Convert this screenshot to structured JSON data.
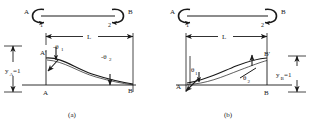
{
  "figure": {
    "caption_a": "(a)",
    "caption_b": "(b)"
  },
  "panel_a": {
    "moment_diagram": {
      "label_A": "A",
      "label_B": "B",
      "label_1": "1",
      "label_2": "2"
    },
    "dimension": {
      "label_L": "L"
    },
    "labels": {
      "A_prime": "A'",
      "A": "A",
      "B": "B",
      "theta1": "-θ",
      "theta1_sub": "1",
      "theta2": "-θ",
      "theta2_sub": "2",
      "deflection": "y",
      "deflection_sub": "A",
      "deflection_value": "=1"
    }
  },
  "panel_b": {
    "moment_diagram": {
      "label_A": "A",
      "label_B": "B",
      "label_1": "1",
      "label_2": "2"
    },
    "dimension": {
      "label_L": "L"
    },
    "labels": {
      "B_prime": "B'",
      "A": "A",
      "B": "B",
      "theta1": "θ",
      "theta1_sub": "1",
      "theta2": "θ",
      "theta2_sub": "2",
      "deflection": "y",
      "deflection_sub": "B",
      "deflection_value": "=1"
    }
  },
  "style": {
    "ink": "#1a1a1a",
    "background": "#ffffff"
  }
}
